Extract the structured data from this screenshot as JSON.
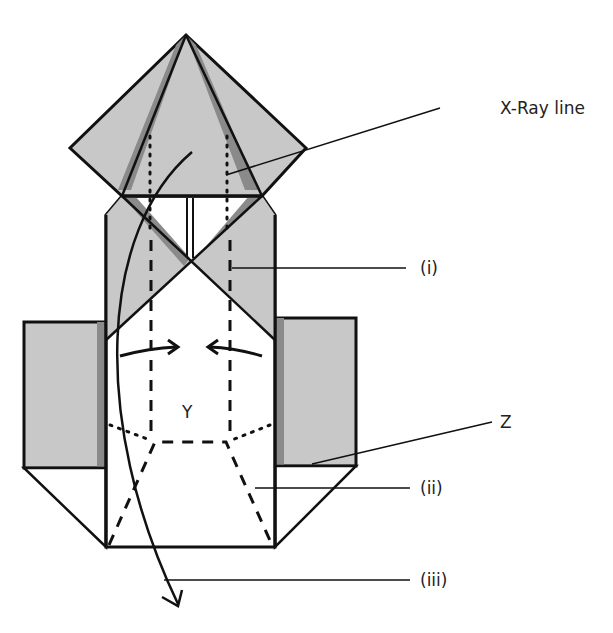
{
  "diagram": {
    "type": "origami folding step",
    "colors": {
      "paper_fill": "#c8c8c8",
      "shadow_fill": "#8a8a8a",
      "line": "#111111",
      "background": "#ffffff"
    },
    "labels": {
      "xray": "X-Ray line",
      "i": "(i)",
      "ii": "(ii)",
      "iii": "(iii)",
      "z": "Z",
      "y": "Y"
    },
    "arrows": [
      {
        "name": "fold-right-arrow",
        "direction": "right"
      },
      {
        "name": "fold-left-arrow",
        "direction": "left"
      },
      {
        "name": "turn-over-arrow",
        "direction": "down"
      }
    ]
  }
}
